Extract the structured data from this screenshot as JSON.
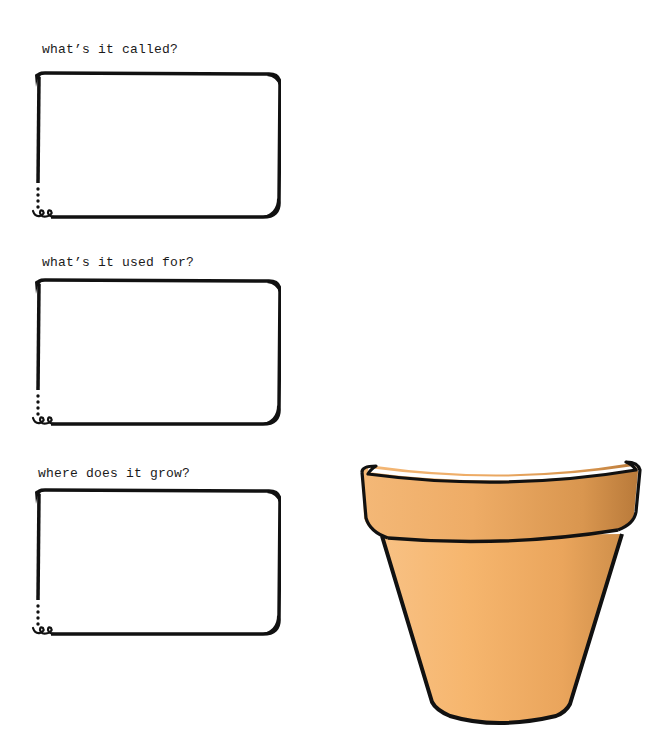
{
  "worksheet": {
    "questions": [
      {
        "label": "what’s it called?",
        "answer": ""
      },
      {
        "label": "what’s it used for?",
        "answer": ""
      },
      {
        "label": "where does it grow?",
        "answer": ""
      }
    ]
  },
  "illustration": {
    "name": "terracotta flower pot",
    "colors": {
      "pot_light": "#f6b66e",
      "pot_mid": "#eaa55c",
      "pot_dark": "#c98a45",
      "outline": "#111111"
    }
  }
}
